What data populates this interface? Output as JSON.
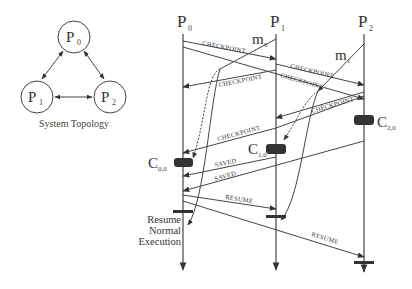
{
  "topology": {
    "caption": "System Topology",
    "nodes": [
      {
        "id": "P0",
        "base": "P",
        "sub": "0"
      },
      {
        "id": "P1",
        "base": "P",
        "sub": "1"
      },
      {
        "id": "P2",
        "base": "P",
        "sub": "2"
      }
    ],
    "links": [
      [
        "P0",
        "P1"
      ],
      [
        "P0",
        "P2"
      ],
      [
        "P1",
        "P2"
      ]
    ]
  },
  "processes": [
    {
      "id": "P0",
      "base": "P",
      "sub": "0"
    },
    {
      "id": "P1",
      "base": "P",
      "sub": "1"
    },
    {
      "id": "P2",
      "base": "P",
      "sub": "2"
    }
  ],
  "app_messages": [
    {
      "id": "m0",
      "base": "m",
      "sub": "0",
      "from": "P1",
      "to": "P0"
    },
    {
      "id": "m1",
      "base": "m",
      "sub": "1",
      "from": "P2",
      "to": "P1"
    }
  ],
  "checkpoints": [
    {
      "id": "C00",
      "base": "C",
      "sub": "0,0",
      "process": "P0"
    },
    {
      "id": "C10",
      "base": "C",
      "sub": "1,0",
      "process": "P1"
    },
    {
      "id": "C20",
      "base": "C",
      "sub": "2,0",
      "process": "P2"
    }
  ],
  "protocol_messages": [
    {
      "label": "CHECKPOINT",
      "from": "P0",
      "to": "P1"
    },
    {
      "label": "",
      "from": "P0",
      "to": "P2"
    },
    {
      "label": "CHECKPOINT",
      "from": "P1",
      "to": "P0"
    },
    {
      "label": "CHECKPOINT",
      "from": "P1",
      "to": "P2"
    },
    {
      "label": "CHECKPOINT",
      "from": "P1",
      "to": "P2"
    },
    {
      "label": "CHECKPOINT",
      "from": "P2",
      "to": "P1"
    },
    {
      "label": "",
      "from": "P2",
      "to": "P1"
    },
    {
      "label": "CHECKPOINT",
      "from": "P2",
      "to": "P0"
    },
    {
      "label": "SAVED",
      "from": "P1",
      "to": "P0"
    },
    {
      "label": "SAVED",
      "from": "P2",
      "to": "P0"
    },
    {
      "label": "RESUME",
      "from": "P0",
      "to": "P1"
    },
    {
      "label": "RESUME",
      "from": "P0",
      "to": "P2"
    }
  ],
  "resume_note": [
    "Resume",
    "Normal",
    "Execution"
  ]
}
